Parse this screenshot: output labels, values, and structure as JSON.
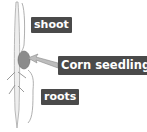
{
  "diagram": {
    "labels": {
      "shoot": "shoot",
      "corn_seedling": "Corn seedling",
      "roots": "roots"
    },
    "colors": {
      "label_bg": "#4a4a4a",
      "label_text": "#ffffff",
      "stem": "#b8b8b8",
      "seed": "#8a8a8a",
      "arrow": "#9a9a9a"
    }
  }
}
